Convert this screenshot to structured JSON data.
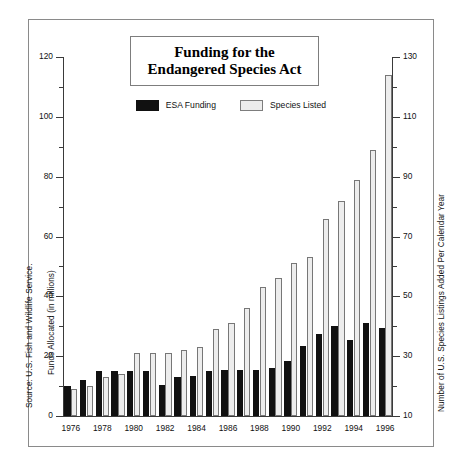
{
  "title": {
    "line1": "Funding for the",
    "line2": "Endangered Species Act"
  },
  "legend": {
    "series1": "ESA Funding",
    "series2": "Species Listed"
  },
  "source_note": "Source: U.S. Fish and Wildlife Service.",
  "axis": {
    "left_label": "Funds Allocated (in millions)",
    "right_label": "Number of U.S. Species Listings Added Per Calendar Year",
    "left_ticks": [
      "0",
      "20",
      "40",
      "60",
      "80",
      "100",
      "120"
    ],
    "right_ticks": [
      "10",
      "30",
      "50",
      "70",
      "90",
      "110",
      "130"
    ]
  },
  "chart_data": {
    "type": "bar",
    "title": "Funding for the Endangered Species Act",
    "xlabel": "",
    "ylabel": "Funds Allocated (in millions)",
    "y2label": "Number of U.S. Species Listings Added Per Calendar Year",
    "ylim": [
      0,
      120
    ],
    "y2lim": [
      10,
      130
    ],
    "grid": false,
    "legend_position": "top-center",
    "categories": [
      "1976",
      "1977",
      "1978",
      "1979",
      "1980",
      "1981",
      "1982",
      "1983",
      "1984",
      "1985",
      "1986",
      "1987",
      "1988",
      "1989",
      "1990",
      "1991",
      "1992",
      "1993",
      "1994",
      "1995",
      "1996"
    ],
    "tick_labels": [
      "1976",
      "",
      "1978",
      "",
      "1980",
      "",
      "1982",
      "",
      "1984",
      "",
      "1986",
      "",
      "1988",
      "",
      "1990",
      "",
      "1992",
      "",
      "1994",
      "",
      "1996"
    ],
    "series": [
      {
        "name": "ESA Funding",
        "axis": "left",
        "units": "millions of dollars",
        "color": "#111111",
        "values": [
          10,
          12,
          15,
          15,
          15,
          15,
          10.5,
          13,
          13.5,
          15,
          15.5,
          15.5,
          15.5,
          16,
          18.5,
          23.5,
          27.5,
          30,
          25.5,
          31,
          29.5
        ]
      },
      {
        "name": "Species Listed",
        "axis": "right",
        "units": "listings added per calendar year",
        "color": "#ededed",
        "values": [
          19,
          20,
          23,
          24,
          31,
          31,
          31,
          32,
          33,
          39,
          41,
          46,
          53,
          56,
          61,
          63,
          76,
          82,
          89,
          99,
          124
        ]
      }
    ]
  }
}
